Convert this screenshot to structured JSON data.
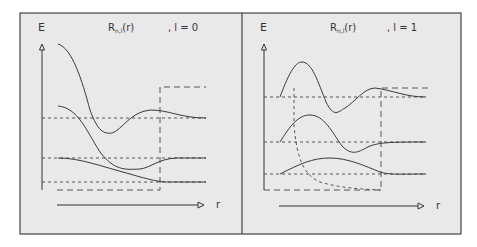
{
  "figure": {
    "background": "#e9e9e9",
    "frame_color": "#444444",
    "curve_color": "#3a3a3a",
    "dash_color": "#555555"
  },
  "panels": [
    {
      "id": "l0",
      "y_axis_label": "E",
      "x_axis_label": "r",
      "title_func": "R",
      "title_sub": "n,l",
      "title_arg": "(r)",
      "title_l": ", l = 0"
    },
    {
      "id": "l1",
      "y_axis_label": "E",
      "x_axis_label": "r",
      "title_func": "R",
      "title_sub": "n,l",
      "title_arg": "(r)",
      "title_l": ", l = 1"
    }
  ]
}
